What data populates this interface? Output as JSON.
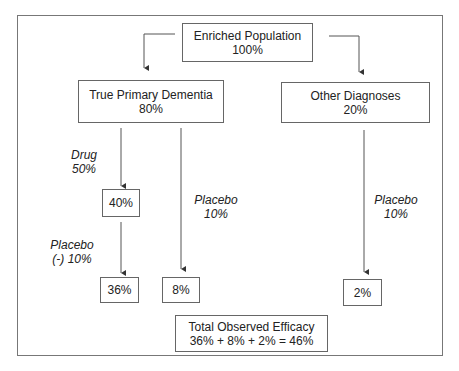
{
  "diagram": {
    "root": {
      "title": "Enriched Population",
      "value": "100%"
    },
    "left_branch": {
      "title": "True Primary Dementia",
      "value": "80%"
    },
    "right_branch": {
      "title": "Other Diagnoses",
      "value": "20%"
    },
    "drug_label": {
      "line1": "Drug",
      "line2": "50%"
    },
    "drug_result": "40%",
    "placebo_minus_label": {
      "line1": "Placebo",
      "line2": "(-) 10%"
    },
    "placebo_minus_result": "36%",
    "placebo_left_label": {
      "line1": "Placebo",
      "line2": "10%"
    },
    "placebo_left_result": "8%",
    "placebo_right_label": {
      "line1": "Placebo",
      "line2": "10%"
    },
    "placebo_right_result": "2%",
    "total": {
      "title": "Total Observed Efficacy",
      "equation": "36% + 8% + 2% = 46%"
    }
  }
}
